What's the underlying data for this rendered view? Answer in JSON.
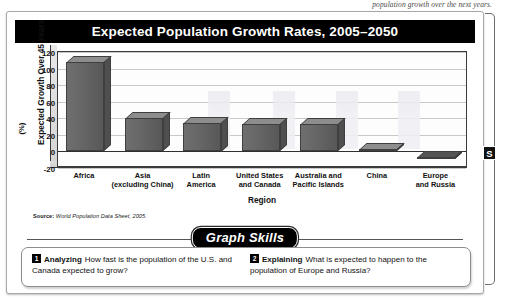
{
  "page_text_fragment": "population growth over the next years.",
  "section_tab_label": "S",
  "chart": {
    "title": "Expected Population Growth Rates, 2005–2050",
    "y_axis_title": "Expected Growth Over 45 Years",
    "y_axis_unit": "(%)",
    "x_axis_title": "Region",
    "source": "World Population Data Sheet, 2005.",
    "source_prefix": "Source:"
  },
  "chart_data": {
    "type": "bar",
    "title": "Expected Population Growth Rates, 2005–2050",
    "xlabel": "Region",
    "ylabel": "Expected Growth Over 45 Years (%)",
    "categories": [
      "Africa",
      "Asia (excluding China)",
      "Latin America",
      "United States and Canada",
      "Australia and Pacific Islands",
      "China",
      "Europe and Russia"
    ],
    "values": [
      115,
      47,
      42,
      40,
      40,
      10,
      -3
    ],
    "ylim": [
      -20,
      120
    ],
    "yticks": [
      120,
      100,
      80,
      60,
      40,
      20,
      0,
      -20
    ],
    "grid": true,
    "legend": false
  },
  "skills": {
    "badge": "Graph Skills",
    "questions": [
      {
        "number": "1",
        "verb": "Analyzing",
        "text": "How fast is the population of the U.S. and Canada expected to grow?"
      },
      {
        "number": "2",
        "verb": "Explaining",
        "text": "What is expected to happen to the population of Europe and Russia?"
      }
    ]
  }
}
